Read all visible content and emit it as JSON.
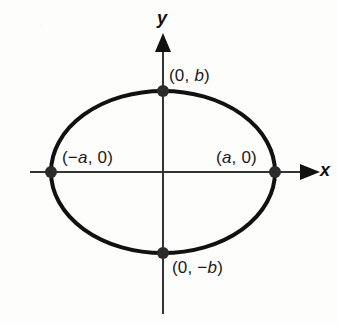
{
  "figure": {
    "background_color": "#fdfdfc",
    "ink_color": "#111111"
  },
  "axes": {
    "x_label": "x",
    "y_label": "y",
    "x_axis_color": "#333333",
    "y_axis_color": "#333333",
    "origin": {
      "x": 163,
      "y": 172
    }
  },
  "labels": {
    "top_vertex": "(0, b)",
    "bottom_vertex": "(0, −b)",
    "left_vertex": "(−a, 0)",
    "right_vertex": "(a, 0)"
  },
  "chart_data": {
    "type": "scatter",
    "xlabel": "x",
    "ylabel": "y",
    "grid": false,
    "legend": null,
    "curve": {
      "name": "ellipse",
      "equation": "x^2/a^2 + y^2/b^2 = 1",
      "center": [
        0,
        0
      ],
      "semi_major_axis_a": 112,
      "semi_minor_axis_b": 81,
      "stroke_width": 4,
      "stroke_color": "#111111"
    },
    "points": [
      {
        "label": "(0, b)",
        "x": 0,
        "y": 81,
        "marker": "filled-circle"
      },
      {
        "label": "(0, −b)",
        "x": 0,
        "y": -81,
        "marker": "filled-circle"
      },
      {
        "label": "(−a, 0)",
        "x": -112,
        "y": 0,
        "marker": "filled-circle"
      },
      {
        "label": "(a, 0)",
        "x": 112,
        "y": 0,
        "marker": "filled-circle"
      }
    ],
    "annotations": [
      {
        "text": "(0, b)",
        "x": 0,
        "y": 81,
        "position": "right-above"
      },
      {
        "text": "(0, −b)",
        "x": 0,
        "y": -81,
        "position": "right-below"
      },
      {
        "text": "(−a, 0)",
        "x": -112,
        "y": 0,
        "position": "right-above"
      },
      {
        "text": "(a, 0)",
        "x": 112,
        "y": 0,
        "position": "left-above"
      }
    ],
    "xlim": [
      -133,
      175
    ],
    "ylim": [
      -141,
      135
    ]
  }
}
